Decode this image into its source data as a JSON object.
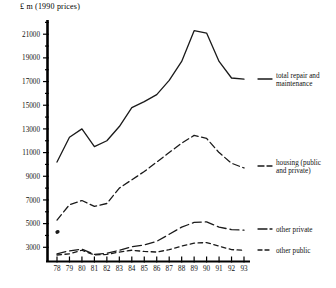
{
  "axis_unit_label": "£ m  (1990 prices)",
  "chart_data": {
    "type": "line",
    "title": "",
    "subtitle": "",
    "xlabel": "",
    "ylabel": "£ m  (1990 prices)",
    "categories": [
      "78",
      "79",
      "80",
      "81",
      "82",
      "83",
      "84",
      "85",
      "86",
      "87",
      "88",
      "89",
      "90",
      "91",
      "92",
      "93"
    ],
    "x_tick_labels": [
      "78",
      "79",
      "80",
      "81",
      "82",
      "83",
      "84",
      "85",
      "86",
      "87",
      "88",
      "89",
      "90",
      "91",
      "92",
      "93"
    ],
    "y_tick_labels": [
      "3000",
      "5000",
      "7000",
      "9000",
      "11000",
      "13000",
      "15000",
      "17000",
      "19000",
      "21000"
    ],
    "y_tick_values": [
      3000,
      5000,
      7000,
      9000,
      11000,
      13000,
      15000,
      17000,
      19000,
      21000
    ],
    "y_minor_tick_values": [
      4000,
      6000,
      8000,
      10000,
      12000,
      14000,
      16000,
      18000,
      20000,
      22000
    ],
    "ylim": [
      1800,
      22200
    ],
    "xlim": [
      "78",
      "93"
    ],
    "grid": false,
    "legend_position": "right-of-plot-at-series-end",
    "series": [
      {
        "name": "total repair and maintenance",
        "legend_label": "total repair and maintenance",
        "line_style": "solid",
        "color": "#1a1a1a",
        "values": [
          10200,
          12300,
          13000,
          11500,
          12000,
          13200,
          14800,
          15300,
          15900,
          17100,
          18700,
          21300,
          21100,
          18700,
          17300,
          17200
        ]
      },
      {
        "name": "housing (public and private)",
        "legend_label": "housing (public and private)",
        "line_style": "dashed-long",
        "color": "#1a1a1a",
        "values": [
          5300,
          6600,
          6950,
          6450,
          6700,
          8000,
          8700,
          9400,
          10200,
          11000,
          11800,
          12450,
          12200,
          11000,
          10100,
          9700
        ]
      },
      {
        "name": "other private",
        "legend_label": "other private",
        "line_style": "dashed-medium",
        "color": "#1a1a1a",
        "values": [
          2450,
          2700,
          2850,
          2400,
          2500,
          2750,
          3050,
          3200,
          3500,
          4100,
          4700,
          5100,
          5150,
          4700,
          4500,
          4450
        ]
      },
      {
        "name": "other public",
        "legend_label": "other public",
        "line_style": "dashed-short",
        "color": "#1a1a1a",
        "values": [
          2350,
          2450,
          2750,
          2350,
          2400,
          2600,
          2750,
          2650,
          2600,
          2800,
          3100,
          3350,
          3400,
          3100,
          2800,
          2750
        ]
      }
    ],
    "stray_marks": [
      {
        "note": "small scan artifact near year 78 at approx 4300",
        "x": "78",
        "y": 4300
      }
    ]
  },
  "legend": {
    "items": [
      {
        "label": "total repair and maintenance",
        "style": "solid"
      },
      {
        "label": "housing (public and private)",
        "style": "dashed-long"
      },
      {
        "label": "other private",
        "style": "dashed-medium"
      },
      {
        "label": "other public",
        "style": "dashed-short"
      }
    ]
  },
  "legend_labels": {
    "total_line1": "total repair and",
    "total_line2": "maintenance",
    "housing_line1": "housing (public",
    "housing_line2": "and private)",
    "other_private": "other private",
    "other_public": "other public"
  }
}
